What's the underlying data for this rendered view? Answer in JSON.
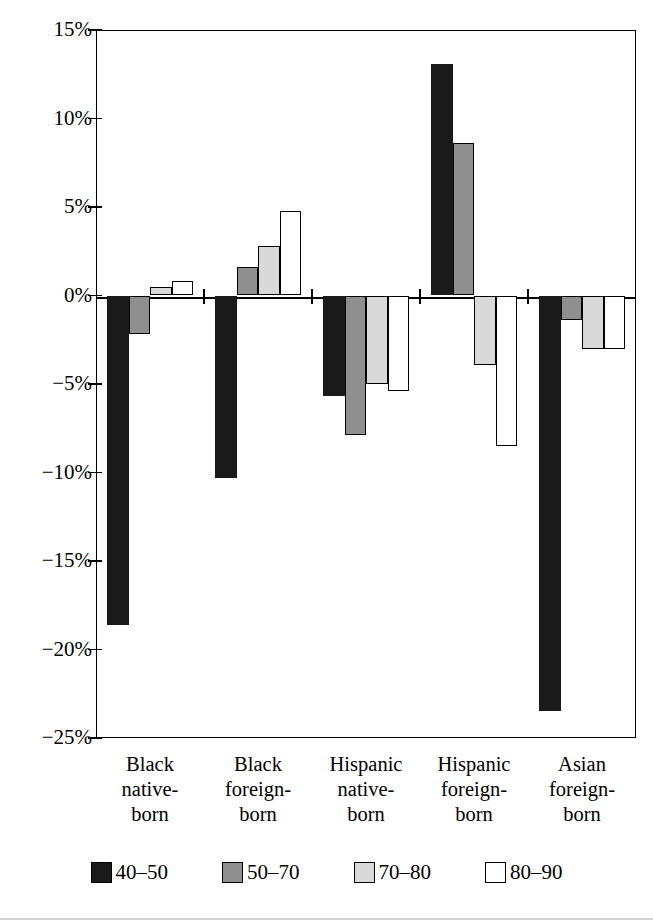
{
  "chart_data": {
    "type": "bar",
    "title": "",
    "subtitle": "",
    "xlabel": "",
    "ylabel": "",
    "ylim": [
      -25,
      15
    ],
    "ytick_values": [
      15,
      10,
      5,
      0,
      -5,
      -10,
      -15,
      -20,
      -25
    ],
    "ytick_labels": [
      "15%",
      "10%",
      "5%",
      "0%",
      "−5%",
      "−10%",
      "−15%",
      "−20%",
      "−25%"
    ],
    "grid": false,
    "legend_position": "bottom",
    "value_format": "percent",
    "categories": [
      "Black\nnative-\nborn",
      "Black\nforeign-\nborn",
      "Hispanic\nnative-\nborn",
      "Hispanic\nforeign-\nborn",
      "Asian\nforeign-\nborn"
    ],
    "series": [
      {
        "name": "40–50",
        "color": "#1a1a1a",
        "values": [
          -18.6,
          -10.3,
          -5.7,
          13.1,
          -23.5
        ]
      },
      {
        "name": "50–70",
        "color": "#8f8f8f",
        "values": [
          -2.2,
          1.6,
          -7.9,
          8.6,
          -1.4
        ]
      },
      {
        "name": "70–80",
        "color": "#d9d9d9",
        "values": [
          0.5,
          2.8,
          -5.0,
          -3.9,
          -3.0
        ]
      },
      {
        "name": "80–90",
        "color": "#ffffff",
        "values": [
          0.8,
          4.8,
          -5.4,
          -8.5,
          -3.0
        ]
      }
    ]
  },
  "legend": {
    "items": [
      {
        "label": "40–50",
        "swatch": "black-swatch"
      },
      {
        "label": "50–70",
        "swatch": "dark-gray-swatch"
      },
      {
        "label": "70–80",
        "swatch": "light-gray-swatch"
      },
      {
        "label": "80–90",
        "swatch": "white-swatch"
      }
    ]
  }
}
